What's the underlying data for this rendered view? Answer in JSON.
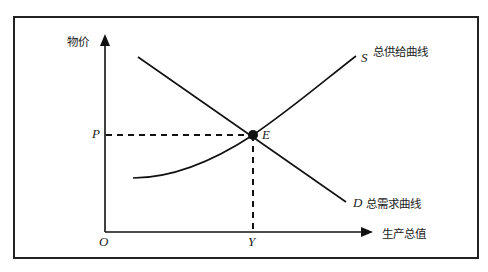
{
  "diagram": {
    "type": "aggregate supply-demand diagram",
    "y_axis_label": "物价",
    "x_axis_label": "生产总值",
    "origin_label": "O",
    "price_label": "P",
    "output_label": "Y",
    "equilibrium_label": "E",
    "supply_curve": {
      "letter": "S",
      "name": "总供给曲线"
    },
    "demand_curve": {
      "letter": "D",
      "name": "总需求曲线"
    },
    "colors": {
      "line": "#111111",
      "frame": "#222222",
      "background": "#ffffff"
    }
  }
}
